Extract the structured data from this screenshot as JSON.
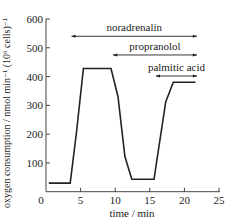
{
  "chart_data": {
    "type": "line",
    "title": "",
    "xlabel": "time / min",
    "ylabel": "oxygen consumption / nmol min⁻¹ (10⁶ cells)⁻¹",
    "xlim": [
      0,
      25
    ],
    "ylim": [
      0,
      600
    ],
    "xticks": [
      0,
      5,
      10,
      15,
      20,
      25
    ],
    "yticks": [
      100,
      200,
      300,
      400,
      500,
      600
    ],
    "grid": false,
    "series": [
      {
        "name": "oxygen consumption",
        "color": "#222222",
        "x": [
          0.4,
          3.5,
          4.4,
          5.4,
          9.4,
          10.4,
          11.4,
          12.4,
          15.6,
          17.3,
          18.4,
          21.6
        ],
        "y": [
          30,
          30,
          204,
          428,
          428,
          330,
          122,
          43,
          43,
          312,
          380,
          380
        ]
      }
    ],
    "annotations": [
      {
        "label": "noradrenalin",
        "type": "double-arrow",
        "x_start": 3.7,
        "x_end": 21.8,
        "y": 540
      },
      {
        "label": "propranolol",
        "type": "double-arrow",
        "x_start": 9.7,
        "x_end": 21.8,
        "y": 475
      },
      {
        "label": "palmitic acid",
        "type": "double-arrow",
        "x_start": 15.9,
        "x_end": 21.8,
        "y": 402
      }
    ]
  }
}
